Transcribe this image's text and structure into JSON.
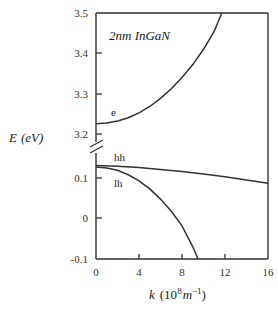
{
  "chart_data": {
    "type": "line",
    "title": "2nm InGaN",
    "xlabel": "k (10^8 m^-1)",
    "ylabel": "E (eV)",
    "xlim": [
      0,
      16
    ],
    "ylim_upper": [
      3.2,
      3.5
    ],
    "ylim_lower": [
      -0.1,
      0.15
    ],
    "broken_y_axis": true,
    "grid": false,
    "legend": "inline labels",
    "x_ticks": [
      "0",
      "4",
      "8",
      "12",
      "16"
    ],
    "y_ticks_upper": [
      "3.2",
      "3.3",
      "3.4",
      "3.5"
    ],
    "y_ticks_lower": [
      "-0.1",
      "0",
      "0.1"
    ],
    "series": [
      {
        "name": "e",
        "panel": "upper",
        "x": [
          0,
          1,
          2,
          3,
          4,
          5,
          6,
          7,
          8,
          9,
          10,
          11,
          11.7
        ],
        "y": [
          3.225,
          3.227,
          3.232,
          3.24,
          3.252,
          3.268,
          3.288,
          3.312,
          3.34,
          3.372,
          3.41,
          3.455,
          3.5
        ]
      },
      {
        "name": "hh",
        "panel": "lower",
        "x": [
          0,
          2,
          4,
          6,
          8,
          10,
          12,
          14,
          16
        ],
        "y": [
          0.131,
          0.129,
          0.126,
          0.121,
          0.116,
          0.11,
          0.103,
          0.095,
          0.087
        ]
      },
      {
        "name": "lh",
        "panel": "lower",
        "x": [
          0,
          1,
          2,
          3,
          4,
          5,
          6,
          7,
          8,
          9,
          9.5
        ],
        "y": [
          0.127,
          0.125,
          0.119,
          0.108,
          0.093,
          0.073,
          0.048,
          0.018,
          -0.018,
          -0.07,
          -0.1
        ]
      }
    ]
  },
  "labels": {
    "title": "2nm InGaN",
    "ylabel_var": "E",
    "ylabel_unit": "(eV)",
    "xlabel_var": "k",
    "xlabel_unit_open": "(10",
    "xlabel_exp": "8",
    "xlabel_m": "m",
    "xlabel_exp2": "−1",
    "xlabel_close": ")",
    "e": "e",
    "hh": "hh",
    "lh": "lh",
    "xt0": "0",
    "xt1": "4",
    "xt2": "8",
    "xt3": "12",
    "xt4": "16",
    "yu0": "3.2",
    "yu1": "3.3",
    "yu2": "3.4",
    "yu3": "3.5",
    "yl0": "-0.1",
    "yl1": "0",
    "yl2": "0.1"
  }
}
